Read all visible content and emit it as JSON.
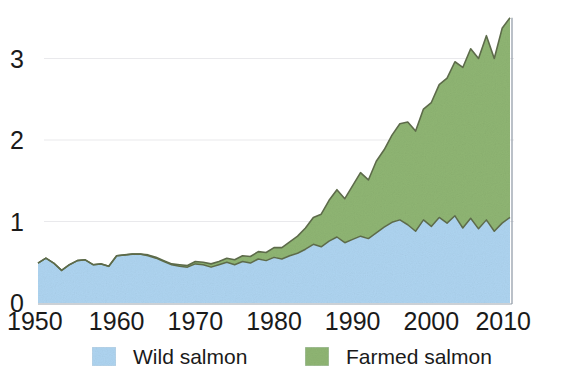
{
  "chart_data": {
    "type": "area",
    "stacked": true,
    "title": "",
    "subtitle": "",
    "xlabel": "",
    "ylabel": "",
    "xlim": [
      1950,
      2010
    ],
    "ylim": [
      0,
      3.6
    ],
    "grid": true,
    "grid_axis": "y",
    "legend_position": "bottom",
    "x_tick_labels": [
      "1950",
      "1960",
      "1970",
      "1980",
      "1990",
      "2000",
      "2010"
    ],
    "x_ticks": [
      1950,
      1960,
      1970,
      1980,
      1990,
      2000,
      2010
    ],
    "y_tick_labels": [
      "0",
      "1",
      "2",
      "3"
    ],
    "y_ticks": [
      0,
      1,
      2,
      3
    ],
    "colors": {
      "wild": "#aed4f0",
      "farmed": "#8fb573",
      "outline": "#5d6b4a",
      "grid": "#e9e9ec",
      "text": "#1a1a1a",
      "background": "#ffffff"
    },
    "x": [
      1950,
      1951,
      1952,
      1953,
      1954,
      1955,
      1956,
      1957,
      1958,
      1959,
      1960,
      1961,
      1962,
      1963,
      1964,
      1965,
      1966,
      1967,
      1968,
      1969,
      1970,
      1971,
      1972,
      1973,
      1974,
      1975,
      1976,
      1977,
      1978,
      1979,
      1980,
      1981,
      1982,
      1983,
      1984,
      1985,
      1986,
      1987,
      1988,
      1989,
      1990,
      1991,
      1992,
      1993,
      1994,
      1995,
      1996,
      1997,
      1998,
      1999,
      2000,
      2001,
      2002,
      2003,
      2004,
      2005,
      2006,
      2007,
      2008,
      2009,
      2010
    ],
    "series": [
      {
        "name": "Wild salmon",
        "color": "#aed4f0",
        "values": [
          0.49,
          0.55,
          0.49,
          0.4,
          0.47,
          0.52,
          0.53,
          0.47,
          0.48,
          0.45,
          0.58,
          0.59,
          0.6,
          0.6,
          0.58,
          0.55,
          0.51,
          0.47,
          0.45,
          0.44,
          0.48,
          0.47,
          0.44,
          0.47,
          0.5,
          0.47,
          0.51,
          0.49,
          0.54,
          0.52,
          0.56,
          0.54,
          0.58,
          0.61,
          0.66,
          0.72,
          0.69,
          0.76,
          0.81,
          0.74,
          0.78,
          0.82,
          0.79,
          0.86,
          0.93,
          0.99,
          1.02,
          0.96,
          0.88,
          1.02,
          0.94,
          1.05,
          0.98,
          1.07,
          0.92,
          1.04,
          0.91,
          1.02,
          0.88,
          0.98,
          1.05
        ]
      },
      {
        "name": "Farmed salmon",
        "color": "#8fb573",
        "values": [
          0.0,
          0.0,
          0.0,
          0.0,
          0.0,
          0.0,
          0.0,
          0.0,
          0.0,
          0.0,
          0.0,
          0.0,
          0.0,
          0.0,
          0.01,
          0.01,
          0.01,
          0.01,
          0.02,
          0.02,
          0.03,
          0.03,
          0.04,
          0.04,
          0.05,
          0.06,
          0.07,
          0.08,
          0.09,
          0.1,
          0.12,
          0.14,
          0.17,
          0.21,
          0.26,
          0.33,
          0.4,
          0.5,
          0.58,
          0.54,
          0.66,
          0.78,
          0.72,
          0.88,
          0.95,
          1.07,
          1.18,
          1.26,
          1.23,
          1.36,
          1.52,
          1.63,
          1.78,
          1.89,
          1.97,
          2.08,
          2.09,
          2.26,
          2.12,
          2.39,
          2.45
        ]
      }
    ],
    "totals": [
      0.49,
      0.55,
      0.49,
      0.4,
      0.47,
      0.52,
      0.53,
      0.47,
      0.48,
      0.45,
      0.58,
      0.59,
      0.6,
      0.6,
      0.59,
      0.56,
      0.52,
      0.48,
      0.47,
      0.46,
      0.51,
      0.5,
      0.48,
      0.51,
      0.55,
      0.53,
      0.58,
      0.57,
      0.63,
      0.62,
      0.68,
      0.68,
      0.75,
      0.82,
      0.92,
      1.05,
      1.09,
      1.26,
      1.39,
      1.28,
      1.44,
      1.6,
      1.51,
      1.74,
      1.88,
      2.06,
      2.2,
      2.22,
      2.11,
      2.38,
      2.46,
      2.68,
      2.76,
      2.96,
      2.89,
      3.12,
      3.0,
      3.28,
      3.0,
      3.37,
      3.5
    ]
  },
  "legend": {
    "items": [
      {
        "label": "Wild salmon",
        "color": "#aed4f0"
      },
      {
        "label": "Farmed salmon",
        "color": "#8fb573"
      }
    ]
  }
}
